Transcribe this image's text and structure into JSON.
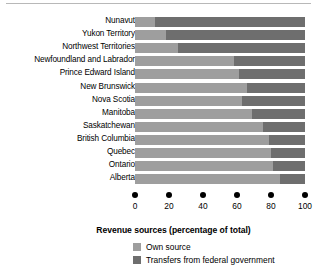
{
  "chart_data": {
    "type": "bar",
    "orientation": "horizontal",
    "stacked": true,
    "title": "",
    "xlabel": "Revenue sources (percentage of total)",
    "ylabel": "",
    "xlim": [
      0,
      100
    ],
    "xticks": [
      0,
      20,
      40,
      60,
      80,
      100
    ],
    "xticklabels": [
      "0",
      "20",
      "40",
      "60",
      "80",
      "100"
    ],
    "grid": false,
    "legend_position": "bottom-left",
    "categories": [
      "Nunavut",
      "Yukon Territory",
      "Northwest Territories",
      "Newfoundland and Labrador",
      "Prince Edward Island",
      "New Brunswick",
      "Nova Scotia",
      "Manitoba",
      "Saskatchewan",
      "British Columbia",
      "Quebec",
      "Ontario",
      "Alberta"
    ],
    "series": [
      {
        "name": "Own source",
        "color": "#9e9e9e",
        "values": [
          12,
          18,
          25,
          58,
          61,
          66,
          63,
          69,
          75,
          79,
          80,
          81,
          85
        ]
      },
      {
        "name": "Transfers from federal government",
        "color": "#6e6e6e",
        "values": [
          88,
          82,
          75,
          42,
          39,
          34,
          37,
          31,
          25,
          21,
          20,
          19,
          15
        ]
      }
    ]
  },
  "axis": {
    "title": "Revenue sources (percentage of total)",
    "ticks": [
      {
        "value": 0,
        "label": "0"
      },
      {
        "value": 20,
        "label": "20"
      },
      {
        "value": 40,
        "label": "40"
      },
      {
        "value": 60,
        "label": "60"
      },
      {
        "value": 80,
        "label": "80"
      },
      {
        "value": 100,
        "label": "100"
      }
    ]
  },
  "legend": {
    "items": [
      {
        "label": "Own source",
        "color": "#9e9e9e"
      },
      {
        "label": "Transfers from federal government",
        "color": "#6e6e6e"
      }
    ]
  },
  "colors": {
    "own_source": "#9e9e9e",
    "transfers": "#6e6e6e",
    "background": "#ffffff",
    "text": "#000000",
    "rule": "#b8b8b8"
  }
}
